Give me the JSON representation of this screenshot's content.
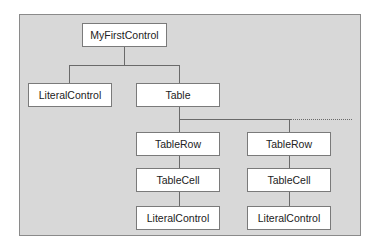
{
  "diagram": {
    "nodes": [
      {
        "id": "root",
        "label": "MyFirstControl"
      },
      {
        "id": "lit1",
        "label": "LiteralControl"
      },
      {
        "id": "table",
        "label": "Table"
      },
      {
        "id": "row1",
        "label": "TableRow"
      },
      {
        "id": "row2",
        "label": "TableRow"
      },
      {
        "id": "cell1",
        "label": "TableCell"
      },
      {
        "id": "cell2",
        "label": "TableCell"
      },
      {
        "id": "lit2",
        "label": "LiteralControl"
      },
      {
        "id": "lit3",
        "label": "LiteralControl"
      }
    ],
    "edges": [
      [
        "root",
        "lit1"
      ],
      [
        "root",
        "table"
      ],
      [
        "table",
        "row1"
      ],
      [
        "table",
        "row2"
      ],
      [
        "row1",
        "cell1"
      ],
      [
        "row2",
        "cell2"
      ],
      [
        "cell1",
        "lit2"
      ],
      [
        "cell2",
        "lit3"
      ]
    ]
  }
}
